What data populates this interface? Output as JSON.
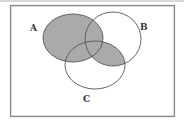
{
  "diagram": {
    "type": "venn",
    "sets": [
      {
        "label": "A",
        "cx": 73,
        "cy": 38,
        "rx": 30,
        "ry": 24
      },
      {
        "label": "B",
        "cx": 113,
        "cy": 39,
        "rx": 28,
        "ry": 27
      },
      {
        "label": "C",
        "cx": 95,
        "cy": 65,
        "rx": 30,
        "ry": 24
      }
    ],
    "shaded_region": "A ∪ (B ∩ C)",
    "shade_color": "#aaaaaa",
    "line_color": "#555555",
    "frame_color": "#888888",
    "labels": {
      "a": "A",
      "b": "B",
      "c": "C"
    }
  }
}
